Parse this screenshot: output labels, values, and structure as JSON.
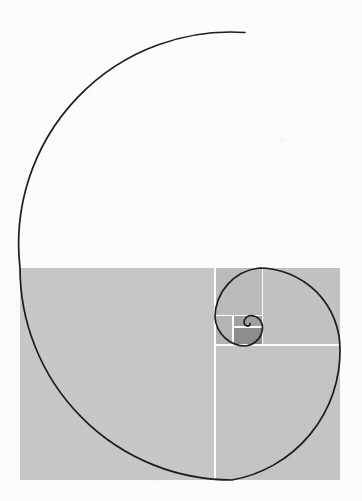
{
  "figure": {
    "title": "Golden spiral with Fibonacci squares",
    "caption": "",
    "background_color": "#ffffff",
    "line_color": "#1c1c1c",
    "divider_color": "#ffffff",
    "fill_light": "#c9c9c9",
    "fill_medium": "#b4b4b4",
    "fill_dark": "#9a9a9a",
    "fill_darkest": "#8a8a8a",
    "spiral_stroke_width": 1.7,
    "divider_stroke_width": 1.6
  },
  "chart_data": {
    "type": "diagram",
    "title": "Golden spiral with Fibonacci squares",
    "bounds": {
      "x": 20,
      "y": 268,
      "width": 320,
      "height": 212
    },
    "spiral_center": {
      "x": 243.2,
      "y": 322.0
    },
    "spiral_growth_ratio": 1.618,
    "spiral_quarter_turns": 8,
    "squares": [
      {
        "index": 1,
        "label": "largest-square",
        "x": 20,
        "y": 268,
        "size": 212,
        "fill": "#c9c9c9"
      },
      {
        "index": 2,
        "label": "square-2",
        "x": 232,
        "y": 268,
        "size": 131,
        "fill": "#c9c9c9"
      },
      {
        "index": 3,
        "label": "square-3",
        "x": 232,
        "y": 399,
        "size": 81,
        "fill": "#c9c9c9"
      },
      {
        "index": 4,
        "label": "square-4",
        "x": 151,
        "y": 399,
        "size": 50,
        "fill": "#c9c9c9"
      },
      {
        "index": 5,
        "label": "square-5",
        "x": 201,
        "y": 430,
        "size": 31,
        "fill": "#b4b4b4"
      },
      {
        "index": 6,
        "label": "square-6",
        "x": 232,
        "y": 430,
        "size": 19,
        "fill": "#9a9a9a"
      },
      {
        "index": 7,
        "label": "square-7",
        "x": 232,
        "y": 411,
        "size": 12,
        "fill": "#8a8a8a"
      }
    ],
    "divider_lines": [
      {
        "label": "vertical-main-divider",
        "x1": 215.0,
        "y1": 268.0,
        "x2": 215.0,
        "y2": 480.0
      },
      {
        "label": "horizontal-right-divider",
        "x1": 215.0,
        "y1": 345.0,
        "x2": 340.0,
        "y2": 345.0
      },
      {
        "label": "vertical-inner-divider",
        "x1": 262.5,
        "y1": 268.0,
        "x2": 262.5,
        "y2": 345.0
      },
      {
        "label": "horizontal-inner-divider",
        "x1": 215.0,
        "y1": 315.5,
        "x2": 262.5,
        "y2": 315.5
      },
      {
        "label": "vertical-inner2-divider",
        "x1": 233.0,
        "y1": 315.5,
        "x2": 233.0,
        "y2": 345.0
      },
      {
        "label": "horizontal-inner2-divider",
        "x1": 233.0,
        "y1": 326.8,
        "x2": 262.5,
        "y2": 326.8
      }
    ],
    "outer_rect": {
      "left": 20.0,
      "top": 268.0,
      "right": 340.0,
      "bottom": 480.0,
      "width": 320.0,
      "height": 212.0,
      "aspect_ratio": 1.509
    },
    "spiral_endpoint_outer": {
      "x": 245.0,
      "y": 32.5
    },
    "spiral_extremes": {
      "leftmost_x": 20.0,
      "topmost_y": 32.5,
      "rightmost_x": 340.0,
      "bottommost_y": 480.0
    },
    "grid": false,
    "legend": null,
    "annotations": []
  }
}
